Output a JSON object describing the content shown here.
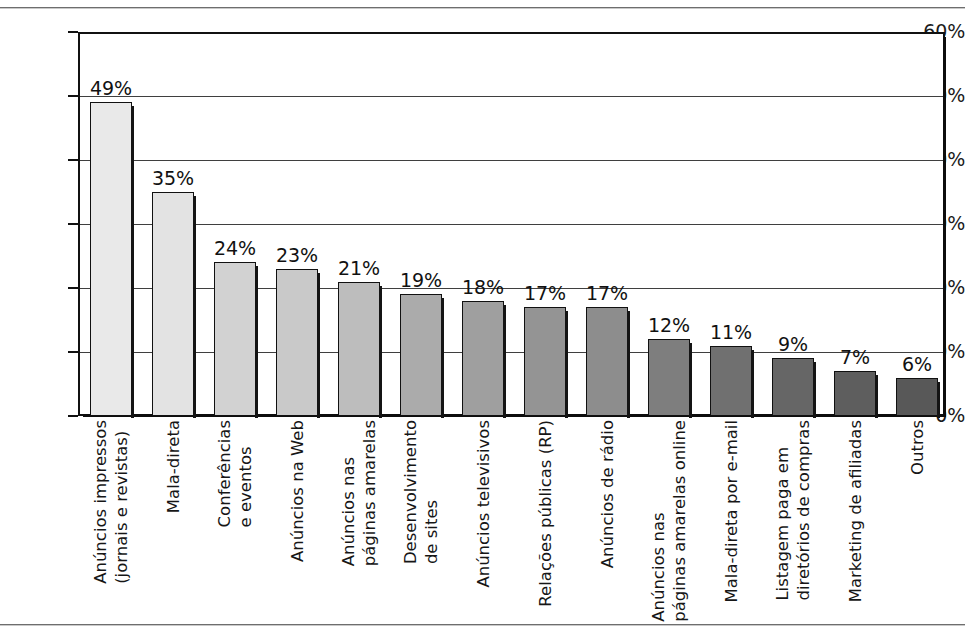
{
  "chart_data": {
    "type": "bar",
    "title": "",
    "subtitle": "",
    "xlabel": "",
    "ylabel": "",
    "ylim": [
      0,
      60
    ],
    "y_tick_labels": [
      "60%",
      "50%",
      "40%",
      "30%",
      "20%",
      "10%",
      "0%"
    ],
    "y_ticks": [
      60,
      50,
      40,
      30,
      20,
      10,
      0
    ],
    "grid": true,
    "grid_axis": "y",
    "legend": false,
    "value_label_suffix": "%",
    "categories": [
      "Anúncios impressos (jornais e revistas)",
      "Mala-direta",
      "Conferências e eventos",
      "Anúncios na Web",
      "Anúncios nas páginas amarelas",
      "Desenvolvimento de sites",
      "Anúncios televisivos",
      "Relações públicas (RP)",
      "Anúncios de rádio",
      "Anúncios nas páginas amarelas online",
      "Mala-direta por e-mail",
      "Listagem paga em diretórios de compras",
      "Marketing de afiliadas",
      "Outros"
    ],
    "category_lines": [
      [
        "Anúncios impressos",
        "(jornais e revistas)"
      ],
      [
        "Mala-direta",
        ""
      ],
      [
        "Conferências",
        "e eventos"
      ],
      [
        "Anúncios na Web",
        ""
      ],
      [
        "Anúncios nas",
        "páginas amarelas"
      ],
      [
        "Desenvolvimento",
        "de sites"
      ],
      [
        "Anúncios televisivos",
        ""
      ],
      [
        "Relações públicas (RP)",
        ""
      ],
      [
        "Anúncios de rádio",
        ""
      ],
      [
        "Anúncios nas",
        "páginas amarelas online"
      ],
      [
        "Mala-direta por e-mail",
        ""
      ],
      [
        "Listagem paga em",
        "diretórios de compras"
      ],
      [
        "Marketing de afiliadas",
        ""
      ],
      [
        "Outros",
        ""
      ]
    ],
    "values": [
      49,
      35,
      24,
      23,
      21,
      19,
      18,
      17,
      17,
      12,
      11,
      9,
      7,
      6
    ],
    "value_labels": [
      "49%",
      "35%",
      "24%",
      "23%",
      "21%",
      "19%",
      "18%",
      "17%",
      "17%",
      "12%",
      "11%",
      "9%",
      "7%",
      "6%"
    ],
    "bar_colors": [
      "#e9e9e9",
      "#e3e3e3",
      "#d2d2d2",
      "#c9c9c9",
      "#bdbdbd",
      "#ababab",
      "#9f9f9f",
      "#949494",
      "#8d8d8d",
      "#7e7e7e",
      "#707070",
      "#666666",
      "#5e5e5e",
      "#585858"
    ],
    "frame_color": "#111111",
    "gridline_color": "#3f3f3f",
    "background_color": "#ffffff"
  }
}
